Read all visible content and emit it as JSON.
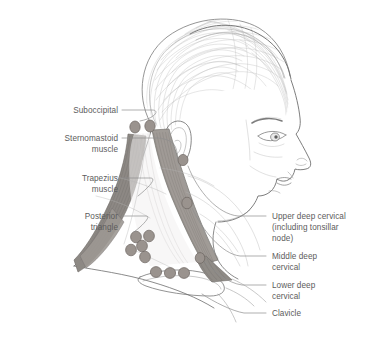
{
  "figure": {
    "background_color": "#ffffff",
    "label_color": "#5c5c5c",
    "leader_color": "#8e8e8e",
    "node_fill": "#9a938e",
    "node_stroke": "#6d6661",
    "outline_color": "#6f6f6f",
    "muscle_dark": "#8d8984",
    "muscle_mid": "#a9a5a0",
    "muscle_light": "#c9c6c2",
    "hair_color": "#b4b4b4"
  },
  "labels_left": [
    {
      "id": "suboccipital",
      "lines": [
        "Suboccipital"
      ],
      "x": 118,
      "y": 113
    },
    {
      "id": "sternomastoid-muscle",
      "lines": [
        "Sternomastoid",
        "muscle"
      ],
      "x": 118,
      "y": 148
    },
    {
      "id": "trapezius-muscle",
      "lines": [
        "Trapezius",
        "muscle"
      ],
      "x": 118,
      "y": 187
    },
    {
      "id": "posterior-triangle",
      "lines": [
        "Posterior",
        "triangle"
      ],
      "x": 118,
      "y": 224
    }
  ],
  "labels_right": [
    {
      "id": "upper-deep-cervical",
      "lines": [
        "Upper deep cervical",
        "(including tonsillar",
        "node)"
      ],
      "x": 272,
      "y": 222
    },
    {
      "id": "middle-deep-cervical",
      "lines": [
        "Middle deep",
        "cervical"
      ],
      "x": 272,
      "y": 261
    },
    {
      "id": "lower-deep-cervical",
      "lines": [
        "Lower deep",
        "cervical"
      ],
      "x": 272,
      "y": 290
    },
    {
      "id": "clavicle",
      "lines": [
        "Clavicle"
      ],
      "x": 272,
      "y": 316
    }
  ],
  "lymph_nodes": {
    "suboccipital": [
      {
        "cx": 135,
        "cy": 127,
        "rx": 5.2,
        "ry": 6.0
      },
      {
        "cx": 150,
        "cy": 126,
        "rx": 5.2,
        "ry": 6.0
      }
    ],
    "upper_deep_cervical": [
      {
        "cx": 183,
        "cy": 160,
        "rx": 5.0,
        "ry": 5.6
      }
    ],
    "middle_deep_cervical": [
      {
        "cx": 187,
        "cy": 203,
        "rx": 5.2,
        "ry": 5.8
      }
    ],
    "lower_deep_cervical": [
      {
        "cx": 200,
        "cy": 258,
        "rx": 4.8,
        "ry": 5.4
      }
    ],
    "posterior_triangle": [
      {
        "cx": 136,
        "cy": 237,
        "rx": 5.4,
        "ry": 5.8
      },
      {
        "cx": 149,
        "cy": 236,
        "rx": 5.4,
        "ry": 5.8
      },
      {
        "cx": 142,
        "cy": 246,
        "rx": 5.4,
        "ry": 5.8
      },
      {
        "cx": 131,
        "cy": 250,
        "rx": 5.4,
        "ry": 5.8
      },
      {
        "cx": 145,
        "cy": 257,
        "rx": 5.4,
        "ry": 5.8
      }
    ],
    "supraclavicular": [
      {
        "cx": 156,
        "cy": 272,
        "rx": 5.6,
        "ry": 5.4
      },
      {
        "cx": 170,
        "cy": 273,
        "rx": 5.6,
        "ry": 5.4
      },
      {
        "cx": 184,
        "cy": 273,
        "rx": 5.6,
        "ry": 5.4
      }
    ]
  },
  "anatomy": {
    "subject": "female head in right-facing profile",
    "structures": [
      "hair",
      "ear",
      "eyebrow",
      "eye",
      "nose",
      "lips",
      "chin",
      "jaw",
      "neck",
      "clavicle",
      "sternomastoid muscle",
      "trapezius muscle"
    ]
  }
}
